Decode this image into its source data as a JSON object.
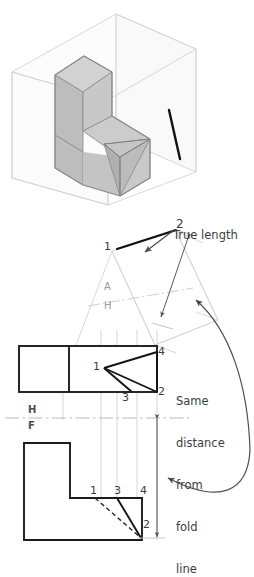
{
  "figure": {
    "title_text": "True length",
    "type": "engineering-orthographic-auxiliary-view-drawing",
    "background_color": "#ffffff",
    "line_color_visible": "#1a1a1a",
    "line_color_projection": "#c9c9c9",
    "line_color_fold": "#b5b5b5",
    "face_shade_top": "#cfcfcf",
    "face_shade_left": "#b4b4b4",
    "face_shade_right": "#c2c2c2",
    "glass_box_color": "#d5d5d5"
  },
  "pictorial": {
    "name": "glass-box-pictorial",
    "description": "isometric glass box containing L-shaped block with beveled notch",
    "true_length_edge_label": "true-length-edge"
  },
  "auxiliary_view": {
    "name": "auxiliary-view",
    "true_length_label": "True length",
    "point_labels": [
      "1",
      "2"
    ],
    "fold_line_labels": {
      "upper": "A",
      "lower": "H"
    }
  },
  "top_view": {
    "name": "top-view",
    "point_labels": [
      "1",
      "2",
      "3",
      "4"
    ]
  },
  "front_view": {
    "name": "front-view",
    "point_labels": [
      "1",
      "2",
      "3",
      "4"
    ]
  },
  "fold_line_hf": {
    "name": "fold-line-h-f",
    "upper": "H",
    "lower": "F"
  },
  "annotation": {
    "name": "same-distance-note",
    "lines": [
      "Same",
      "distance",
      "from",
      "fold",
      "line"
    ],
    "full_text": "Same distance from fold line"
  },
  "labels": {
    "aux_1": "1",
    "aux_2": "2",
    "top_1": "1",
    "top_2": "2",
    "top_3": "3",
    "top_4": "4",
    "front_1": "1",
    "front_2": "2",
    "front_3": "3",
    "front_4": "4",
    "fold_A": "A",
    "fold_H_aux": "H",
    "fold_H": "H",
    "fold_F": "F",
    "note_1": "Same",
    "note_2": "distance",
    "note_3": "from",
    "note_4": "fold",
    "note_5": "line",
    "true_length": "True length"
  }
}
